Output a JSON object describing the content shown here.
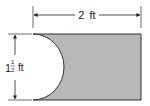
{
  "diagram": {
    "shape": "rectangle with semicircle removed from left side",
    "width_label": {
      "whole": "2",
      "unit": "ft"
    },
    "height_label": {
      "whole": "1",
      "num": "1",
      "den": "2",
      "unit": "ft"
    },
    "colors": {
      "shade": "#b8b8b8",
      "stroke": "#333333",
      "background": "#ffffff"
    }
  }
}
